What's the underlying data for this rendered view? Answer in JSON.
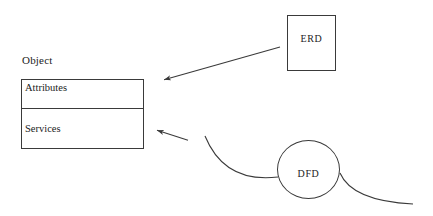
{
  "diagram": {
    "object_title": "Object",
    "object_box": {
      "compartments": [
        {
          "label": "Attributes"
        },
        {
          "label": "Services"
        }
      ]
    },
    "erd_label": "ERD",
    "dfd_label": "DFD",
    "colors": {
      "ink": "#3a3a3a",
      "text": "#222222",
      "background": "#ffffff"
    },
    "connections": [
      {
        "name": "erd-to-object-arrow",
        "from": "ERD",
        "to": "Object box",
        "style": "straight line with arrowhead"
      },
      {
        "name": "dfd-to-services-arrow",
        "from": "DFD flow curve",
        "to": "Services compartment",
        "style": "short line with arrowhead"
      },
      {
        "name": "dfd-left-curve",
        "from": "upper left",
        "to": "DFD circle left edge",
        "style": "curve"
      },
      {
        "name": "dfd-right-curve",
        "from": "DFD circle right edge",
        "to": "lower right",
        "style": "curve"
      }
    ]
  }
}
